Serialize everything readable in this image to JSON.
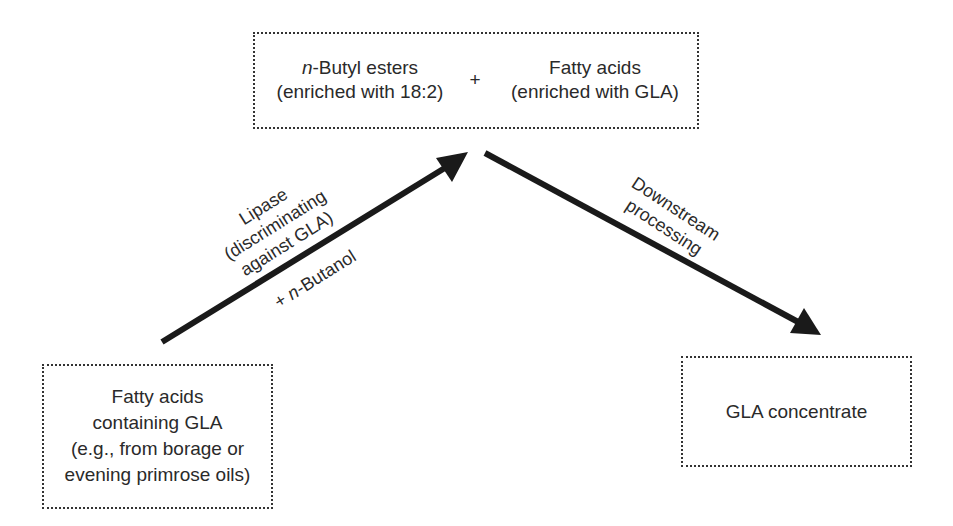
{
  "top_box": {
    "left": {
      "italic_prefix": "n",
      "line1_rest": "-Butyl esters",
      "line2": "(enriched with 18:2)"
    },
    "plus": "+",
    "right": {
      "line1": "Fatty acids",
      "line2": "(enriched with GLA)"
    }
  },
  "source_box": {
    "lines": [
      "Fatty acids",
      "containing GLA",
      "(e.g., from borage or",
      "evening primrose oils)"
    ]
  },
  "product_box": {
    "label": "GLA concentrate"
  },
  "arrow_up": {
    "label_above": [
      "Lipase",
      "(discriminating",
      "against GLA)"
    ],
    "label_below_prefix": "+ ",
    "label_below_italic": "n",
    "label_below_rest": "-Butanol"
  },
  "arrow_down": {
    "label": [
      "Downstream",
      "processing"
    ]
  },
  "colors": {
    "line": "#1a1a1a",
    "text": "#2a2a2a",
    "box_border": "#333333"
  }
}
